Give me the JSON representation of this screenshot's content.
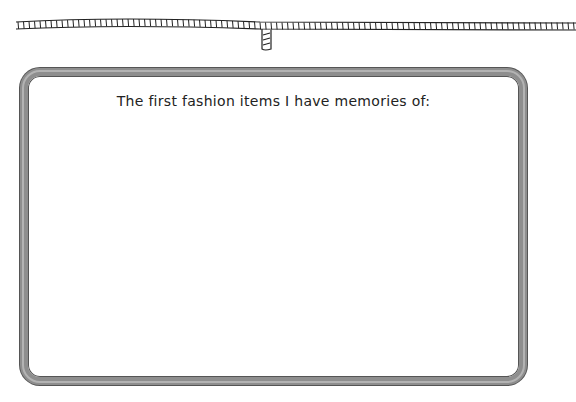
{
  "header": {
    "decoration": "hand-drawn-ruler-tape-with-tab"
  },
  "card": {
    "prompt": "The first fashion items I have memories of:",
    "answer": ""
  },
  "colors": {
    "frame_border": "#8e8e8e",
    "frame_outline": "#555555",
    "text": "#222222",
    "background": "#ffffff"
  }
}
